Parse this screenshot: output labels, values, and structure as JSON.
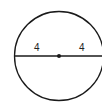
{
  "diagram": {
    "type": "circle-with-diameter",
    "labels": {
      "left_radius": "4",
      "right_radius": "4"
    },
    "colors": {
      "stroke": "#1a1a1a",
      "background": "#ffffff"
    }
  }
}
